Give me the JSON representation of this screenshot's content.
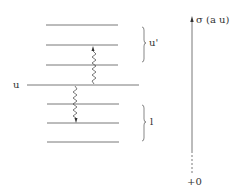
{
  "diagram": {
    "levels": {
      "upper_group_label": "u'",
      "middle_level_label": "u",
      "lower_group_label": "l",
      "upper_lines_y": [
        25,
        45,
        65
      ],
      "middle_line_y": 85,
      "lower_lines_y": [
        104,
        123,
        142
      ]
    },
    "transitions": [
      {
        "name": "absorption",
        "from": "u",
        "to": "u'",
        "direction": "up"
      },
      {
        "name": "emission",
        "from": "u",
        "to": "l",
        "direction": "down"
      }
    ],
    "axis": {
      "label": "σ (a u)",
      "origin_label": "+0"
    },
    "colors": {
      "line": "#555555",
      "text": "#333333"
    }
  }
}
